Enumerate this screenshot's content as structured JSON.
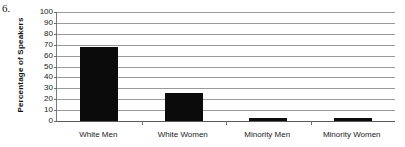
{
  "figure": {
    "number_label": "6."
  },
  "chart_data": {
    "type": "bar",
    "title": "",
    "xlabel": "",
    "ylabel": "Percentage of Speakers",
    "categories": [
      "White Men",
      "White Women",
      "Minority Men",
      "Minority Women"
    ],
    "values": [
      68,
      26,
      3,
      3
    ],
    "ylim": [
      0,
      100
    ],
    "ytick_values": [
      0,
      10,
      20,
      30,
      40,
      50,
      60,
      70,
      80,
      90,
      100
    ],
    "ytick_labels": [
      "0",
      "10",
      "20",
      "30",
      "40",
      "50",
      "60",
      "70",
      "80",
      "90",
      "100"
    ],
    "grid": true,
    "legend": false,
    "bar_color": "#0b0b0b",
    "axis_color": "#7a7a7a",
    "grid_color": "#9a9a9a"
  }
}
